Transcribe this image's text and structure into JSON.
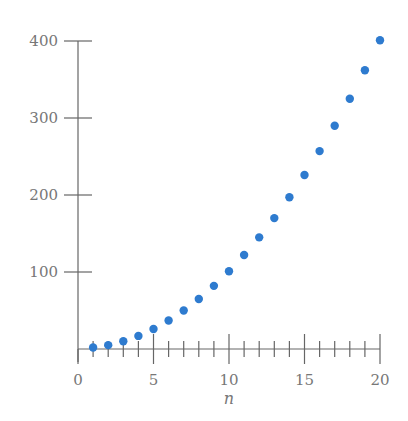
{
  "chart_data": {
    "type": "scatter",
    "title": "",
    "xlabel": "n",
    "ylabel": "",
    "xlim": [
      0,
      20
    ],
    "ylim": [
      0,
      400
    ],
    "x_ticks_major": [
      0,
      5,
      10,
      15,
      20
    ],
    "x_ticks_minor_step": 1,
    "y_ticks": [
      100,
      200,
      300,
      400
    ],
    "grid": false,
    "legend": null,
    "point_color": "#2e7bcf",
    "series": [
      {
        "name": "a_n",
        "x": [
          1,
          2,
          3,
          4,
          5,
          6,
          7,
          8,
          9,
          10,
          11,
          12,
          13,
          14,
          15,
          16,
          17,
          18,
          19,
          20
        ],
        "y": [
          2,
          5,
          10,
          17,
          26,
          37,
          50,
          65,
          82,
          101,
          122,
          145,
          170,
          197,
          226,
          257,
          290,
          325,
          362,
          401
        ]
      }
    ]
  },
  "axis": {
    "x_tick_labels": [
      "0",
      "5",
      "10",
      "15",
      "20"
    ],
    "y_tick_labels": [
      "100",
      "200",
      "300",
      "400"
    ],
    "x_label": "n"
  }
}
